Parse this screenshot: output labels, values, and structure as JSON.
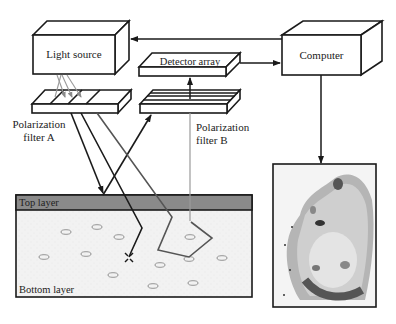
{
  "components": {
    "light_source": {
      "label": "Light source"
    },
    "detector_array": {
      "label": "Detector array"
    },
    "computer": {
      "label": "Computer"
    },
    "filter_a": {
      "label_line1": "Polarization",
      "label_line2": "filter A"
    },
    "filter_b": {
      "label_line1": "Polarization",
      "label_line2": "filter B"
    }
  },
  "tissue": {
    "top_layer_label": "Top layer",
    "bottom_layer_label": "Bottom layer"
  },
  "colors": {
    "line": "#1a1a1a",
    "top_layer": "#8a8a8a",
    "bottom_layer": "#f2f2f2",
    "grey_ray": "#9a9a9a",
    "polygon_path": "#555555"
  },
  "output_image": {
    "description": "tissue-scan-image"
  }
}
